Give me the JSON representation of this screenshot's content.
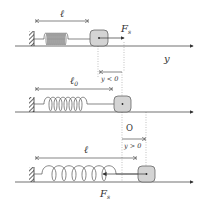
{
  "diagram": {
    "colors": {
      "line": "#333333",
      "block_fill": "#d4d4d4",
      "block_stroke": "#555555",
      "dotted": "#999999",
      "background": "#ffffff"
    },
    "panels": [
      {
        "id": "compressed",
        "length_label": "ℓ",
        "force_label": "F",
        "force_subscript": "s",
        "axis_label": "y"
      },
      {
        "id": "equilibrium",
        "length_label": "ℓ",
        "length_subscript": "0",
        "displacement_label": "y < 0",
        "origin_label": "O"
      },
      {
        "id": "stretched",
        "length_label": "ℓ",
        "displacement_label": "y > 0",
        "force_label": "F",
        "force_subscript": "s"
      }
    ]
  }
}
